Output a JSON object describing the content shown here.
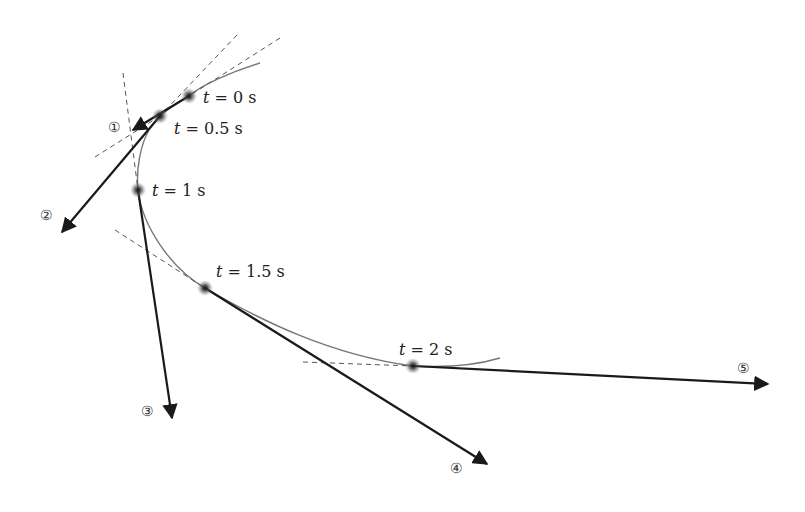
{
  "diagram": {
    "title": "",
    "points": [
      {
        "id": "p0",
        "label_var": "t",
        "label_eq": " = 0 s",
        "x": 189,
        "y": 96
      },
      {
        "id": "p1",
        "label_var": "t",
        "label_eq": " = 0.5 s",
        "x": 160,
        "y": 116
      },
      {
        "id": "p2",
        "label_var": "t",
        "label_eq": " = 1 s",
        "x": 138,
        "y": 190
      },
      {
        "id": "p3",
        "label_var": "t",
        "label_eq": " = 1.5 s",
        "x": 205,
        "y": 288
      },
      {
        "id": "p4",
        "label_var": "t",
        "label_eq": " = 2 s",
        "x": 413,
        "y": 366
      }
    ],
    "arrows": [
      {
        "id": "a1",
        "label": "①",
        "from": [
          189,
          96
        ],
        "to": [
          133,
          130
        ]
      },
      {
        "id": "a2",
        "label": "②",
        "from": [
          160,
          116
        ],
        "to": [
          62,
          232
        ]
      },
      {
        "id": "a3",
        "label": "③",
        "from": [
          138,
          190
        ],
        "to": [
          172,
          418
        ]
      },
      {
        "id": "a4",
        "label": "④",
        "from": [
          205,
          288
        ],
        "to": [
          487,
          464
        ]
      },
      {
        "id": "a5",
        "label": "⑤",
        "from": [
          413,
          366
        ],
        "to": [
          768,
          384
        ]
      }
    ],
    "labels": {
      "t0": {
        "var": "t",
        "eq": "= 0 s"
      },
      "t05": {
        "var": "t",
        "eq": "= 0.5 s"
      },
      "t1": {
        "var": "t",
        "eq": "= 1 s"
      },
      "t15": {
        "var": "t",
        "eq": "= 1.5 s"
      },
      "t2": {
        "var": "t",
        "eq": "= 2 s"
      },
      "n1": "①",
      "n2": "②",
      "n3": "③",
      "n4": "④",
      "n5": "⑤"
    },
    "colors": {
      "curve": "#777777",
      "arrow": "#1a1a1a",
      "dashed": "#555555",
      "dot": "#222222"
    }
  }
}
